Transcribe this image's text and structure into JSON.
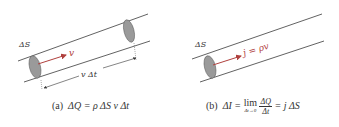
{
  "colors": {
    "line": "#3a3a3a",
    "arrow": "#b0413e",
    "surface_fill": "#9a9a9a",
    "text": "#333333"
  },
  "panel_a": {
    "label_dS": "ΔS",
    "label_v": "v",
    "label_vdt": "v Δt",
    "caption_tag": "(a)",
    "caption_formula": "ΔQ = ρ ΔS  v Δt"
  },
  "panel_b": {
    "label_dS": "ΔS",
    "label_j": "j = ρv",
    "caption_tag": "(b)",
    "caption_lhs": "ΔI =",
    "caption_lim": "lim",
    "caption_lim_sub": "Δt→0",
    "caption_num": "ΔQ",
    "caption_den": "Δt",
    "caption_rhs": "= j ΔS"
  }
}
